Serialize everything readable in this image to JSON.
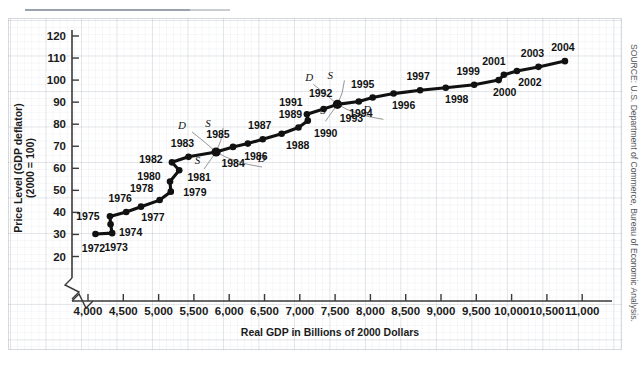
{
  "figure": {
    "source_note": "SOURCE: U.S. Department of Commerce, Bureau of Economic Analysis.",
    "ylabel_line1": "Price Level (GDP deflator)",
    "ylabel_line2": "(2000 = 100)",
    "xtitle": "Real GDP in Billions of 2000 Dollars"
  },
  "chart_data": {
    "type": "scatter",
    "title": "",
    "xlabel": "Real GDP in Billions of 2000 Dollars",
    "ylabel": "Price Level (GDP deflator) (2000 = 100)",
    "xlim": [
      3800,
      11100
    ],
    "ylim": [
      15,
      125
    ],
    "grid": true,
    "legend": "none",
    "axis_break_x": true,
    "xticks": [
      "4,000",
      "4,500",
      "5,000",
      "5,500",
      "6,000",
      "6,500",
      "7,000",
      "7,500",
      "8,000",
      "8,500",
      "9,000",
      "9,500",
      "10,000",
      "10,500",
      "11,000"
    ],
    "xtick_values": [
      4000,
      4500,
      5000,
      5500,
      6000,
      6500,
      7000,
      7500,
      8000,
      8500,
      9000,
      9500,
      10000,
      10500,
      11000
    ],
    "yticks": [
      "20",
      "30",
      "40",
      "50",
      "60",
      "70",
      "80",
      "90",
      "100",
      "110",
      "120"
    ],
    "ytick_values": [
      20,
      30,
      40,
      50,
      60,
      70,
      80,
      90,
      100,
      110,
      120
    ],
    "points": [
      {
        "label": "1972",
        "x": 4106,
        "y": 30.2,
        "lx": -2,
        "ly": 18,
        "anchor": "middle"
      },
      {
        "label": "1973",
        "x": 4342,
        "y": 30.6,
        "lx": 4,
        "ly": 18,
        "anchor": "middle"
      },
      {
        "label": "1974",
        "x": 4320,
        "y": 34.6,
        "lx": 20,
        "ly": 12,
        "anchor": "middle"
      },
      {
        "label": "1975",
        "x": 4311,
        "y": 38.2,
        "lx": -22,
        "ly": 4,
        "anchor": "middle"
      },
      {
        "label": "1976",
        "x": 4541,
        "y": 40.2,
        "lx": -6,
        "ly": -10,
        "anchor": "middle"
      },
      {
        "label": "1977",
        "x": 4751,
        "y": 42.6,
        "lx": 12,
        "ly": 14,
        "anchor": "middle"
      },
      {
        "label": "1978",
        "x": 5015,
        "y": 45.6,
        "lx": -18,
        "ly": -8,
        "anchor": "middle"
      },
      {
        "label": "1979",
        "x": 5173,
        "y": 49.4,
        "lx": 24,
        "ly": 4,
        "anchor": "middle"
      },
      {
        "label": "1980",
        "x": 5162,
        "y": 54.0,
        "lx": -21,
        "ly": -2,
        "anchor": "middle"
      },
      {
        "label": "1981",
        "x": 5292,
        "y": 59.1,
        "lx": 20,
        "ly": 11,
        "anchor": "middle"
      },
      {
        "label": "1982",
        "x": 5189,
        "y": 62.7,
        "lx": -21,
        "ly": 1,
        "anchor": "middle"
      },
      {
        "label": "1983",
        "x": 5424,
        "y": 65.2,
        "lx": -6,
        "ly": -10,
        "anchor": "middle"
      },
      {
        "label": "1984",
        "x": 5814,
        "y": 67.4,
        "lx": 17,
        "ly": 15,
        "anchor": "middle"
      },
      {
        "label": "1985",
        "x": 6054,
        "y": 69.7,
        "lx": -15,
        "ly": -9,
        "anchor": "middle"
      },
      {
        "label": "1986",
        "x": 6264,
        "y": 71.2,
        "lx": 8,
        "ly": 16,
        "anchor": "middle"
      },
      {
        "label": "1987",
        "x": 6475,
        "y": 73.2,
        "lx": -3,
        "ly": -10,
        "anchor": "middle"
      },
      {
        "label": "1988",
        "x": 6743,
        "y": 75.7,
        "lx": 16,
        "ly": 15,
        "anchor": "middle"
      },
      {
        "label": "1989",
        "x": 6981,
        "y": 78.5,
        "lx": -8,
        "ly": -10,
        "anchor": "middle"
      },
      {
        "label": "1990",
        "x": 7113,
        "y": 81.6,
        "lx": 18,
        "ly": 16,
        "anchor": "middle"
      },
      {
        "label": "1991",
        "x": 7101,
        "y": 84.5,
        "lx": -16,
        "ly": -8,
        "anchor": "middle"
      },
      {
        "label": "1992",
        "x": 7337,
        "y": 86.9,
        "lx": -3,
        "ly": -12,
        "anchor": "middle"
      },
      {
        "label": "1993",
        "x": 7533,
        "y": 89.0,
        "lx": 14,
        "ly": 18,
        "anchor": "middle"
      },
      {
        "label": "1994",
        "x": 7836,
        "y": 90.3,
        "lx": 2,
        "ly": 16,
        "anchor": "middle"
      },
      {
        "label": "1995",
        "x": 8032,
        "y": 92.1,
        "lx": -10,
        "ly": -10,
        "anchor": "middle"
      },
      {
        "label": "1996",
        "x": 8329,
        "y": 93.9,
        "lx": 10,
        "ly": 15,
        "anchor": "middle"
      },
      {
        "label": "1997",
        "x": 8704,
        "y": 95.4,
        "lx": -2,
        "ly": -10,
        "anchor": "middle"
      },
      {
        "label": "1998",
        "x": 9067,
        "y": 96.5,
        "lx": 11,
        "ly": 15,
        "anchor": "middle"
      },
      {
        "label": "1999",
        "x": 9470,
        "y": 97.9,
        "lx": -6,
        "ly": -10,
        "anchor": "middle"
      },
      {
        "label": "2000",
        "x": 9817,
        "y": 100.0,
        "lx": 6,
        "ly": 16,
        "anchor": "middle"
      },
      {
        "label": "2001",
        "x": 9891,
        "y": 102.4,
        "lx": -10,
        "ly": -10,
        "anchor": "middle"
      },
      {
        "label": "2002",
        "x": 10075,
        "y": 104.1,
        "lx": 13,
        "ly": 15,
        "anchor": "middle"
      },
      {
        "label": "2003",
        "x": 10381,
        "y": 106.0,
        "lx": -6,
        "ly": -10,
        "anchor": "middle"
      },
      {
        "label": "2004",
        "x": 10755,
        "y": 108.6,
        "lx": -2,
        "ly": -10,
        "anchor": "middle"
      }
    ],
    "annotations": [
      {
        "label": "D",
        "near": "1984",
        "tx": 5330,
        "ty": 77.8,
        "kind": "demand-upper"
      },
      {
        "label": "S",
        "near": "1984",
        "tx": 5700,
        "ty": 78.6,
        "kind": "supply-upper"
      },
      {
        "label": "S",
        "near": "1984",
        "tx": 5550,
        "ty": 62.0,
        "kind": "supply-lower"
      },
      {
        "label": "D",
        "near": "1984",
        "tx": 6460,
        "ty": 62.9,
        "kind": "demand-lower"
      },
      {
        "label": "D",
        "near": "1993",
        "tx": 7135,
        "ty": 99.5,
        "kind": "demand-upper"
      },
      {
        "label": "S",
        "near": "1993",
        "tx": 7430,
        "ty": 100.3,
        "kind": "supply-upper"
      },
      {
        "label": "S",
        "near": "1993",
        "tx": 7330,
        "ty": 84.5,
        "kind": "supply-lower"
      },
      {
        "label": "D",
        "near": "1993",
        "tx": 7955,
        "ty": 85.1,
        "kind": "demand-lower"
      }
    ]
  }
}
